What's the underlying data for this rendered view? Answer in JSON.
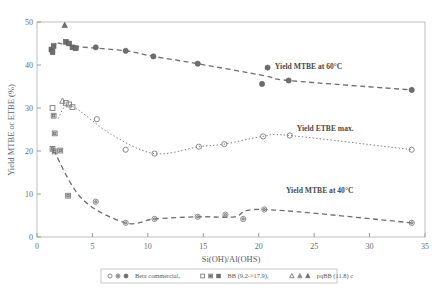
{
  "chart_data": {
    "type": "scatter",
    "title": "",
    "xlabel": "Si(OH)/Al(OHS)",
    "ylabel": "Yield MTBE or ETBE (%)",
    "xlim": [
      0,
      35
    ],
    "ylim": [
      0,
      50
    ],
    "xticks": [
      0,
      5,
      10,
      15,
      20,
      25,
      30,
      35
    ],
    "yticks": [
      0,
      10,
      20,
      30,
      40,
      50
    ],
    "grid": false,
    "legend_position": "bottom",
    "legend": [
      {
        "label": "Beta commercial,",
        "markers": [
          "open-circle",
          "half-circle",
          "filled-circle"
        ]
      },
      {
        "label": "BB (9.2->17.9),",
        "markers": [
          "open-square",
          "half-square",
          "filled-square"
        ]
      },
      {
        "label": "pqBB (11.8) c",
        "markers": [
          "open-triangle",
          "half-triangle",
          "filled-triangle"
        ]
      }
    ],
    "annotations": [
      {
        "text": "Yield MTBE at 60°C",
        "x": 24.5,
        "y": 39.0
      },
      {
        "text": "Yield ETBE max.",
        "x": 26.0,
        "y": 24.6
      },
      {
        "text": "Yield MTBE at 40°C",
        "x": 25.5,
        "y": 10.2
      }
    ],
    "series": [
      {
        "name": "Yield MTBE at 60°C",
        "line_style": "dashed",
        "points": [
          {
            "x": 1.3,
            "y": 43.6,
            "marker": "filled-square"
          },
          {
            "x": 1.4,
            "y": 43.0,
            "marker": "filled-square"
          },
          {
            "x": 1.5,
            "y": 44.4,
            "marker": "filled-square"
          },
          {
            "x": 2.5,
            "y": 49.2,
            "marker": "filled-triangle"
          },
          {
            "x": 2.6,
            "y": 45.4,
            "marker": "filled-square"
          },
          {
            "x": 2.9,
            "y": 45.0,
            "marker": "filled-square"
          },
          {
            "x": 3.2,
            "y": 44.1,
            "marker": "filled-square"
          },
          {
            "x": 3.5,
            "y": 43.9,
            "marker": "filled-square"
          },
          {
            "x": 5.3,
            "y": 44.1,
            "marker": "filled-circle"
          },
          {
            "x": 8.0,
            "y": 43.3,
            "marker": "filled-circle"
          },
          {
            "x": 10.5,
            "y": 42.0,
            "marker": "filled-circle"
          },
          {
            "x": 14.5,
            "y": 40.3,
            "marker": "filled-circle"
          },
          {
            "x": 20.3,
            "y": 35.6,
            "marker": "filled-circle"
          },
          {
            "x": 22.7,
            "y": 36.4,
            "marker": "filled-circle"
          },
          {
            "x": 20.8,
            "y": 39.4,
            "marker": "filled-circle"
          },
          {
            "x": 33.8,
            "y": 34.2,
            "marker": "filled-circle"
          }
        ]
      },
      {
        "name": "Yield ETBE max.",
        "line_style": "dotted",
        "points": [
          {
            "x": 1.4,
            "y": 30.0,
            "marker": "open-square"
          },
          {
            "x": 1.5,
            "y": 28.2,
            "marker": "half-square"
          },
          {
            "x": 1.6,
            "y": 24.1,
            "marker": "half-square"
          },
          {
            "x": 2.3,
            "y": 31.6,
            "marker": "open-triangle"
          },
          {
            "x": 2.6,
            "y": 31.2,
            "marker": "open-square"
          },
          {
            "x": 2.9,
            "y": 30.8,
            "marker": "open-square"
          },
          {
            "x": 3.2,
            "y": 30.2,
            "marker": "open-square"
          },
          {
            "x": 2.1,
            "y": 20.1,
            "marker": "half-square"
          },
          {
            "x": 5.4,
            "y": 27.4,
            "marker": "open-circle"
          },
          {
            "x": 8.0,
            "y": 20.3,
            "marker": "open-circle"
          },
          {
            "x": 10.6,
            "y": 19.4,
            "marker": "open-circle"
          },
          {
            "x": 14.6,
            "y": 21.0,
            "marker": "open-circle"
          },
          {
            "x": 16.9,
            "y": 21.6,
            "marker": "open-circle"
          },
          {
            "x": 20.4,
            "y": 23.4,
            "marker": "open-circle"
          },
          {
            "x": 22.8,
            "y": 23.6,
            "marker": "open-circle"
          },
          {
            "x": 33.8,
            "y": 20.3,
            "marker": "open-circle"
          }
        ]
      },
      {
        "name": "Yield MTBE at 40°C",
        "line_style": "dashed",
        "points": [
          {
            "x": 1.4,
            "y": 20.5,
            "marker": "half-square"
          },
          {
            "x": 1.6,
            "y": 19.9,
            "marker": "half-square"
          },
          {
            "x": 2.8,
            "y": 9.6,
            "marker": "half-square"
          },
          {
            "x": 5.3,
            "y": 8.2,
            "marker": "half-circle"
          },
          {
            "x": 8.0,
            "y": 3.3,
            "marker": "half-circle"
          },
          {
            "x": 10.6,
            "y": 4.2,
            "marker": "half-circle"
          },
          {
            "x": 14.5,
            "y": 4.7,
            "marker": "half-circle"
          },
          {
            "x": 17.0,
            "y": 5.2,
            "marker": "half-circle"
          },
          {
            "x": 18.6,
            "y": 4.2,
            "marker": "half-circle"
          },
          {
            "x": 20.5,
            "y": 6.4,
            "marker": "half-circle"
          },
          {
            "x": 33.8,
            "y": 3.3,
            "marker": "half-circle"
          }
        ]
      }
    ]
  }
}
